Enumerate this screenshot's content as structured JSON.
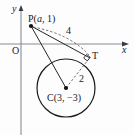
{
  "figure": {
    "type": "geometry-diagram",
    "background_color": "#fdfdfd",
    "stroke_color": "#1a1a1a",
    "axis_color": "#8c8c94",
    "axes": {
      "x_axis_label": "x",
      "y_axis_label": "y",
      "origin_label": "O",
      "x_axis_y_px": 44,
      "y_axis_x_px": 21
    },
    "points": [
      {
        "name": "P",
        "label": "P(a, 1)",
        "label_prefix": "P(",
        "label_var": "a",
        "label_suffix": ", 1)",
        "x_px": 31,
        "y_px": 26,
        "marker": "filled-dot"
      },
      {
        "name": "T",
        "label": "T",
        "x_px": 90,
        "y_px": 58,
        "marker": "none"
      },
      {
        "name": "C",
        "label": "C(3, −3)",
        "label_prefix": "C(3, ",
        "label_value": "−3",
        "label_suffix": ")",
        "x_px": 66,
        "y_px": 88,
        "marker": "filled-dot"
      }
    ],
    "circle": {
      "center_label": "C",
      "center_x_px": 66,
      "center_y_px": 88,
      "radius_px": 29,
      "radius_label": "2",
      "stroke": "#1a1a1a"
    },
    "segments": [
      {
        "name": "PT-tangent",
        "from": "P",
        "to": "T",
        "style": "solid",
        "label": null
      },
      {
        "name": "PT-measure",
        "from": "P",
        "to": "T",
        "style": "dashed",
        "label": "4"
      },
      {
        "name": "PC",
        "from": "P",
        "to": "C",
        "style": "solid",
        "label": null
      },
      {
        "name": "CT-radius",
        "from": "C",
        "to": "T",
        "style": "dashed",
        "label": "2"
      }
    ],
    "labels": {
      "length_pt": "4",
      "length_ct": "2",
      "point_t": "T",
      "origin": "O",
      "axis_x": "x",
      "axis_y": "y"
    },
    "right_angle_marker": {
      "at_point": "T",
      "present": true
    }
  }
}
